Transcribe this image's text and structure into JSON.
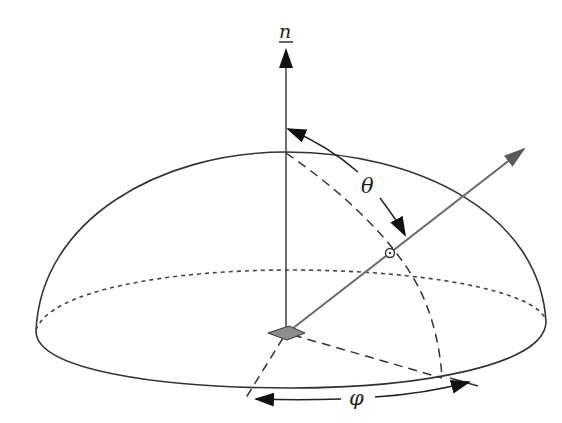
{
  "diagram": {
    "type": "hemisphere-solid-angle",
    "labels": {
      "normal": "n",
      "polar_angle": "θ",
      "azimuth_angle": "φ"
    },
    "colors": {
      "line": "#333333",
      "ray": "#6a6a6a",
      "area_element": "#8c8c8c",
      "background": "#ffffff"
    }
  }
}
